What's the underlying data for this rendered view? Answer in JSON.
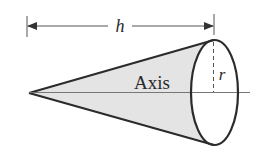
{
  "diagram": {
    "type": "cone",
    "labels": {
      "height": "h",
      "radius": "r",
      "axis": "Axis"
    },
    "colors": {
      "stroke": "#2b2b2b",
      "fill": "#e4e4e4",
      "dim_line": "#555555",
      "axis_line": "#777777",
      "background": "#ffffff"
    }
  }
}
